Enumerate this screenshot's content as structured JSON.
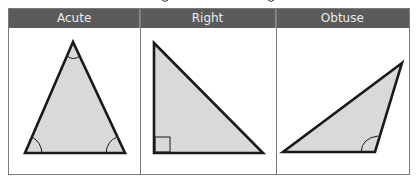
{
  "table": {
    "columns": [
      {
        "label": "Acute",
        "width": 132
      },
      {
        "label": "Right",
        "width": 136
      },
      {
        "label": "Obtuse",
        "width": 134
      }
    ],
    "header_bg": "#5b5b5b",
    "header_text_color": "#ececec",
    "border_color": "#7a7a7a"
  },
  "triangles": {
    "fill": "#d9d9d9",
    "stroke": "#1a1a1a",
    "acute": {
      "type": "acute",
      "points": [
        [
          73,
          42
        ],
        [
          25,
          153
        ],
        [
          125,
          153
        ]
      ],
      "angle_marks": [
        "apex",
        "bottom-left",
        "bottom-right"
      ]
    },
    "right": {
      "type": "right",
      "points": [
        [
          154,
          43
        ],
        [
          154,
          153
        ],
        [
          263,
          153
        ]
      ],
      "angle_marks": [
        "right-angle-square-bottom-left"
      ]
    },
    "obtuse": {
      "type": "obtuse",
      "points": [
        [
          402,
          63
        ],
        [
          283,
          152
        ],
        [
          375,
          152
        ]
      ],
      "angle_marks": [
        "obtuse-arc-bottom-right"
      ]
    }
  }
}
